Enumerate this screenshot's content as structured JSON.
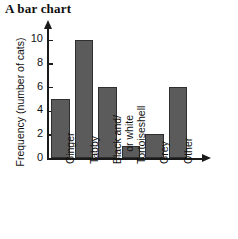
{
  "title": "A bar chart",
  "chart_data": {
    "type": "bar",
    "title": "A bar chart",
    "xlabel": "",
    "ylabel": "Frequency (number of cats)",
    "categories": [
      "Ginger",
      "Tabby",
      "Black and/ or white",
      "Tortoiseshell",
      "Grey",
      "Other"
    ],
    "category_lines": [
      [
        "Ginger"
      ],
      [
        "Tabby"
      ],
      [
        "Black and/",
        "or white"
      ],
      [
        "Tortoiseshell"
      ],
      [
        "Grey"
      ],
      [
        "Other"
      ]
    ],
    "values": [
      5,
      10,
      6,
      1,
      2,
      6
    ],
    "ylim": [
      0,
      11
    ],
    "yticks": [
      0,
      2,
      4,
      6,
      8,
      10
    ],
    "ytick_labels": [
      "0",
      "2",
      "4",
      "6",
      "8",
      "10"
    ],
    "grid": false,
    "legend": null,
    "bar_color": "#5b5b5b",
    "bar_edge_color": "#2f2f2f",
    "axis_color": "#1a1a1a",
    "background": "#ffffff"
  }
}
